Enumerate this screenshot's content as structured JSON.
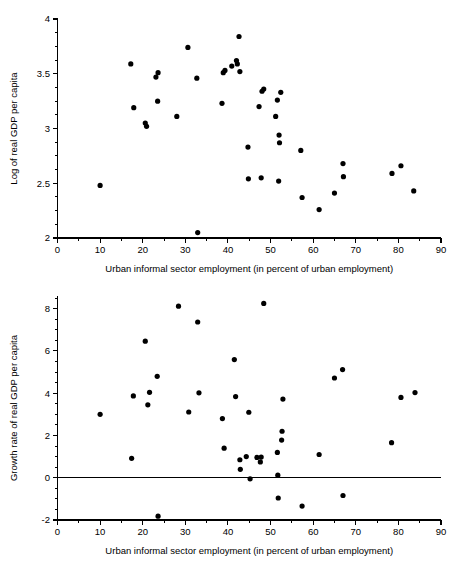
{
  "figure": {
    "background_color": "#ffffff",
    "marker_color": "#000000",
    "axis_color": "#000000"
  },
  "chart_data": [
    {
      "type": "scatter",
      "title": "",
      "subtitle": "",
      "xlabel": "Urban informal sector employment (in percent of urban employment)",
      "ylabel": "Log of real GDP per capita",
      "xlim": [
        0,
        90
      ],
      "ylim": [
        2,
        4
      ],
      "xticks": [
        0,
        10,
        20,
        30,
        40,
        50,
        60,
        70,
        80,
        90
      ],
      "xticklabels": [
        "0",
        "10",
        "20",
        "30",
        "40",
        "50",
        "60",
        "70",
        "80",
        "90"
      ],
      "yticks": [
        2,
        2.5,
        3,
        3.5,
        4
      ],
      "yticklabels": [
        "2",
        "2.5",
        "3",
        "3.5",
        "4"
      ],
      "x_minor_tick_step": 5,
      "y_minor_tick_step": 0.125,
      "grid": false,
      "legend": false,
      "marker": "filled-circle",
      "marker_size_px": 5.2,
      "points": [
        {
          "x": 10.0,
          "y": 2.48
        },
        {
          "x": 17.2,
          "y": 3.59
        },
        {
          "x": 17.9,
          "y": 3.19
        },
        {
          "x": 20.6,
          "y": 3.05
        },
        {
          "x": 20.9,
          "y": 3.02
        },
        {
          "x": 23.1,
          "y": 3.47
        },
        {
          "x": 23.6,
          "y": 3.51
        },
        {
          "x": 23.5,
          "y": 3.25
        },
        {
          "x": 28.0,
          "y": 3.11
        },
        {
          "x": 30.6,
          "y": 3.74
        },
        {
          "x": 32.7,
          "y": 3.46
        },
        {
          "x": 32.9,
          "y": 2.05
        },
        {
          "x": 38.6,
          "y": 3.23
        },
        {
          "x": 38.9,
          "y": 3.51
        },
        {
          "x": 39.3,
          "y": 3.53
        },
        {
          "x": 40.9,
          "y": 3.57
        },
        {
          "x": 42.0,
          "y": 3.62
        },
        {
          "x": 42.2,
          "y": 3.59
        },
        {
          "x": 42.6,
          "y": 3.84
        },
        {
          "x": 42.8,
          "y": 3.52
        },
        {
          "x": 44.7,
          "y": 2.83
        },
        {
          "x": 44.8,
          "y": 2.54
        },
        {
          "x": 47.3,
          "y": 3.2
        },
        {
          "x": 47.8,
          "y": 2.55
        },
        {
          "x": 48.0,
          "y": 3.34
        },
        {
          "x": 48.4,
          "y": 3.36
        },
        {
          "x": 51.2,
          "y": 3.11
        },
        {
          "x": 51.6,
          "y": 3.26
        },
        {
          "x": 51.9,
          "y": 2.52
        },
        {
          "x": 52.0,
          "y": 2.94
        },
        {
          "x": 52.1,
          "y": 2.87
        },
        {
          "x": 52.4,
          "y": 3.33
        },
        {
          "x": 57.1,
          "y": 2.8
        },
        {
          "x": 57.4,
          "y": 2.37
        },
        {
          "x": 61.4,
          "y": 2.26
        },
        {
          "x": 65.0,
          "y": 2.41
        },
        {
          "x": 67.0,
          "y": 2.68
        },
        {
          "x": 67.1,
          "y": 2.56
        },
        {
          "x": 78.5,
          "y": 2.59
        },
        {
          "x": 80.6,
          "y": 2.66
        },
        {
          "x": 83.6,
          "y": 2.43
        }
      ]
    },
    {
      "type": "scatter",
      "title": "",
      "subtitle": "",
      "xlabel": "Urban informal sector employment (in percent of urban employment)",
      "ylabel": "Growth rate of real GDP per capita",
      "xlim": [
        0,
        90
      ],
      "ylim": [
        -2,
        8.6
      ],
      "xticks": [
        0,
        10,
        20,
        30,
        40,
        50,
        60,
        70,
        80,
        90
      ],
      "xticklabels": [
        "0",
        "10",
        "20",
        "30",
        "40",
        "50",
        "60",
        "70",
        "80",
        "90"
      ],
      "yticks": [
        -2,
        0,
        2,
        4,
        6,
        8
      ],
      "yticklabels": [
        "-2",
        "0",
        "2",
        "4",
        "6",
        "8"
      ],
      "x_minor_tick_step": 5,
      "y_minor_tick_step": 0.5,
      "grid": false,
      "legend": false,
      "marker": "filled-circle",
      "marker_size_px": 5.2,
      "reference_line": {
        "y": 0,
        "orientation": "horizontal"
      },
      "points": [
        {
          "x": 10.0,
          "y": 3.0
        },
        {
          "x": 17.4,
          "y": 0.92
        },
        {
          "x": 17.8,
          "y": 3.87
        },
        {
          "x": 20.6,
          "y": 6.46
        },
        {
          "x": 21.2,
          "y": 3.45
        },
        {
          "x": 21.6,
          "y": 4.04
        },
        {
          "x": 23.4,
          "y": 4.8
        },
        {
          "x": 23.6,
          "y": -1.82
        },
        {
          "x": 28.4,
          "y": 8.12
        },
        {
          "x": 30.8,
          "y": 3.11
        },
        {
          "x": 32.9,
          "y": 7.37
        },
        {
          "x": 33.2,
          "y": 4.02
        },
        {
          "x": 38.7,
          "y": 2.8
        },
        {
          "x": 39.1,
          "y": 1.4
        },
        {
          "x": 41.5,
          "y": 5.59
        },
        {
          "x": 41.8,
          "y": 3.84
        },
        {
          "x": 42.8,
          "y": 0.85
        },
        {
          "x": 42.9,
          "y": 0.4
        },
        {
          "x": 44.3,
          "y": 1.0
        },
        {
          "x": 44.9,
          "y": 3.1
        },
        {
          "x": 45.2,
          "y": -0.05
        },
        {
          "x": 46.8,
          "y": 0.96
        },
        {
          "x": 47.6,
          "y": 0.75
        },
        {
          "x": 47.8,
          "y": 0.98
        },
        {
          "x": 48.4,
          "y": 8.25
        },
        {
          "x": 51.6,
          "y": 1.2
        },
        {
          "x": 51.7,
          "y": 0.12
        },
        {
          "x": 51.8,
          "y": -0.96
        },
        {
          "x": 52.6,
          "y": 1.78
        },
        {
          "x": 52.7,
          "y": 2.2
        },
        {
          "x": 52.9,
          "y": 3.72
        },
        {
          "x": 57.4,
          "y": -1.34
        },
        {
          "x": 61.4,
          "y": 1.1
        },
        {
          "x": 65.0,
          "y": 4.72
        },
        {
          "x": 66.9,
          "y": 5.12
        },
        {
          "x": 67.0,
          "y": -0.84
        },
        {
          "x": 78.4,
          "y": 1.66
        },
        {
          "x": 80.6,
          "y": 3.8
        },
        {
          "x": 83.9,
          "y": 4.03
        }
      ]
    }
  ]
}
